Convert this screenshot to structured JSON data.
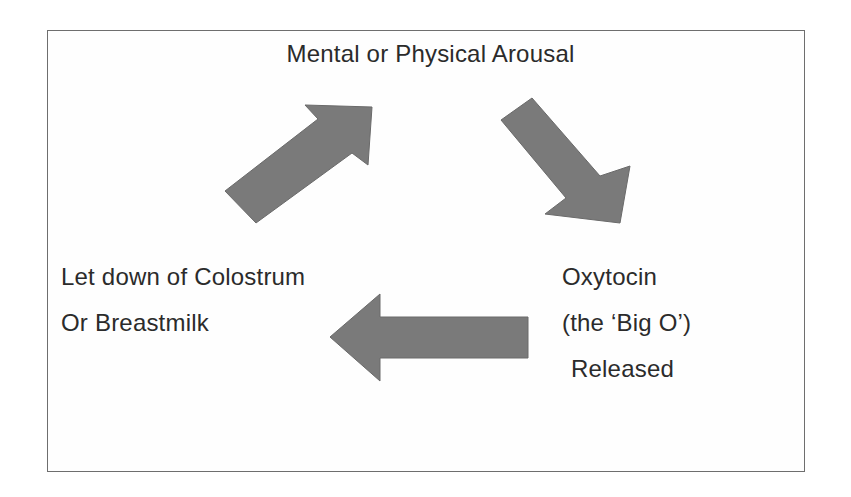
{
  "diagram": {
    "type": "cycle",
    "colors": {
      "border": "#6e6e6e",
      "arrow_fill": "#7a7a7a",
      "text": "#2b2b2b",
      "background": "#ffffff"
    },
    "nodes": {
      "top": {
        "lines": [
          "Mental or Physical Arousal"
        ]
      },
      "right": {
        "lines": [
          "Oxytocin",
          "(the ‘Big O’)",
          "Released"
        ]
      },
      "left": {
        "lines": [
          "Let down of Colostrum",
          "Or Breastmilk"
        ]
      }
    },
    "edges": [
      {
        "from": "left",
        "to": "top",
        "direction": "up-right",
        "icon": "arrow-up-right"
      },
      {
        "from": "top",
        "to": "right",
        "direction": "down-right",
        "icon": "arrow-down-right"
      },
      {
        "from": "right",
        "to": "left",
        "direction": "left",
        "icon": "arrow-left"
      }
    ]
  }
}
